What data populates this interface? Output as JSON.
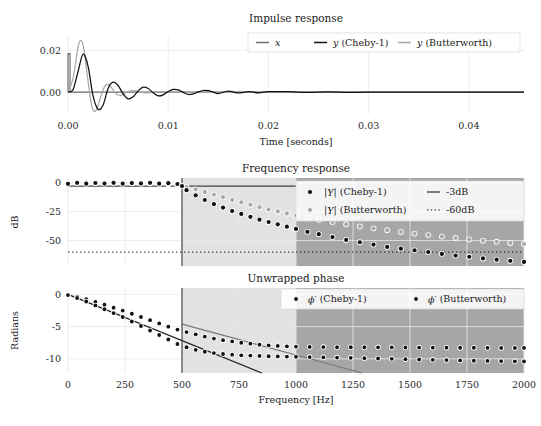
{
  "figure": {
    "width": 541,
    "height": 426,
    "background": "#ffffff"
  },
  "colors": {
    "x_signal": "#6e6e6e",
    "cheby": "#101010",
    "butterworth": "#a8a8a8",
    "grid": "#e9e9e9",
    "text": "#1a1a1a",
    "band_transition": "#e2e2e2",
    "band_stop": "#a6a6a6",
    "cutoff_line": "#3a3a3a",
    "ref_line": "#1a1a1a"
  },
  "panels": {
    "impulse": {
      "title": "Impulse response",
      "xlabel": "Time [seconds]",
      "ylabel": "",
      "xticks": [
        0.0,
        0.01,
        0.02,
        0.03,
        0.04
      ],
      "xticklabels": [
        "0.00",
        "0.01",
        "0.02",
        "0.03",
        "0.04"
      ],
      "yticks": [
        0.0,
        0.02
      ],
      "yticklabels": [
        "0.00",
        "0.02"
      ],
      "xlim": [
        0.0,
        0.0455
      ],
      "ylim": [
        -0.0105,
        0.027
      ],
      "legend": [
        {
          "label": "x",
          "marker": "line",
          "color": "#6e6e6e"
        },
        {
          "label": "y (Cheby-1)",
          "marker": "line",
          "color": "#101010"
        },
        {
          "label": "y (Butterworth)",
          "marker": "line",
          "color": "#a8a8a8"
        }
      ]
    },
    "magnitude": {
      "title": "Frequency response",
      "xlabel": "",
      "ylabel": "dB",
      "xticks": [
        0,
        250,
        500,
        750,
        1000,
        1250,
        1500,
        1750,
        2000
      ],
      "yticks": [
        0,
        -25,
        -50
      ],
      "yticklabels": [
        "0",
        "-25",
        "-50"
      ],
      "xlim": [
        0,
        2000
      ],
      "ylim": [
        -72,
        4
      ],
      "legend": [
        {
          "label": "|Y| (Cheby-1)",
          "marker": "dot",
          "color": "#101010"
        },
        {
          "label": "-3dB",
          "marker": "line",
          "color": "#1a1a1a"
        },
        {
          "label": "|Y| (Butterworth)",
          "marker": "dot",
          "color": "#a8a8a8"
        },
        {
          "label": "-60dB",
          "marker": "dotted",
          "color": "#1a1a1a"
        }
      ],
      "reference_lines": [
        {
          "name": "-3dB",
          "value": -3,
          "style": "solid"
        },
        {
          "name": "-60dB",
          "value": -60,
          "style": "dotted"
        }
      ]
    },
    "phase": {
      "title": "Unwrapped phase",
      "xlabel": "Frequency [Hz]",
      "ylabel": "Radians",
      "xticks": [
        0,
        250,
        500,
        750,
        1000,
        1250,
        1500,
        1750,
        2000
      ],
      "xticklabels": [
        "0",
        "250",
        "500",
        "750",
        "1000",
        "1250",
        "1500",
        "1750",
        "2000"
      ],
      "yticks": [
        0,
        -5,
        -10
      ],
      "yticklabels": [
        "0",
        "-5",
        "-10"
      ],
      "xlim": [
        0,
        2000
      ],
      "ylim": [
        -12.2,
        1.0
      ],
      "legend": [
        {
          "label": "ϕ′ (Cheby-1)",
          "marker": "dot",
          "color": "#101010"
        },
        {
          "label": "ϕ′ (Butterworth)",
          "marker": "dot",
          "color": "#101010"
        }
      ]
    }
  },
  "bands": {
    "passband_edge": 500,
    "transition": [
      500,
      1000
    ],
    "stopband": [
      1000,
      2000
    ]
  },
  "chart_data": {
    "type": "line",
    "subplots": [
      {
        "type": "line",
        "title": "Impulse response",
        "xlabel": "Time [seconds]",
        "ylabel": "",
        "xlim": [
          0.0,
          0.0455
        ],
        "ylim": [
          -0.0105,
          0.027
        ],
        "grid": true,
        "legend_position": "upper right",
        "series": [
          {
            "name": "x",
            "color": "#6e6e6e",
            "comment": "unit impulse at t=0, amplitude 0.0185, zero elsewhere",
            "x": [
              0.0,
              0.0002,
              0.0002,
              0.0455
            ],
            "values": [
              0.0185,
              0.0185,
              0.0,
              0.0
            ]
          },
          {
            "name": "y (Cheby-1)",
            "color": "#101010",
            "comment": "decaying ringing, 500 Hz Chebyshev-1 lowpass impulse response",
            "x": [
              0.0,
              0.0005,
              0.001,
              0.0015,
              0.002,
              0.0025,
              0.003,
              0.0035,
              0.004,
              0.0045,
              0.005,
              0.0055,
              0.006,
              0.0065,
              0.007,
              0.0075,
              0.008,
              0.0085,
              0.009,
              0.0095,
              0.01,
              0.0105,
              0.011,
              0.0115,
              0.012,
              0.0125,
              0.013,
              0.0135,
              0.014,
              0.0145,
              0.015,
              0.016,
              0.017,
              0.018,
              0.019,
              0.02,
              0.022,
              0.024,
              0.026,
              0.028,
              0.03,
              0.035,
              0.04,
              0.0455
            ],
            "values": [
              0.0,
              0.0012,
              0.0098,
              0.0182,
              0.0125,
              -0.0018,
              -0.0082,
              -0.0062,
              0.0018,
              0.0048,
              0.0032,
              -0.0008,
              -0.0032,
              -0.0022,
              0.0006,
              0.0024,
              0.0018,
              -0.0003,
              -0.0018,
              -0.0013,
              0.0003,
              0.0013,
              0.0011,
              -0.0001,
              -0.0011,
              -0.0008,
              0.0001,
              0.0008,
              0.0007,
              0.0,
              -0.0007,
              0.0005,
              -0.0004,
              0.0003,
              -0.0003,
              0.0002,
              0.0002,
              -0.0001,
              0.0001,
              -0.0001,
              0.0,
              0.0,
              0.0,
              0.0
            ]
          },
          {
            "name": "y (Butterworth)",
            "color": "#a8a8a8",
            "comment": "smoother, larger first peak, faster decay",
            "x": [
              0.0,
              0.0005,
              0.001,
              0.0013,
              0.0016,
              0.002,
              0.0024,
              0.0028,
              0.0032,
              0.0036,
              0.004,
              0.0044,
              0.0048,
              0.0052,
              0.0056,
              0.006,
              0.0065,
              0.007,
              0.0075,
              0.008,
              0.009,
              0.01,
              0.012,
              0.014,
              0.016,
              0.02,
              0.025,
              0.03,
              0.0455
            ],
            "values": [
              0.0,
              0.0065,
              0.0215,
              0.0248,
              0.0205,
              0.0052,
              -0.0072,
              -0.0088,
              -0.0032,
              0.0022,
              0.0038,
              0.0018,
              -0.0008,
              -0.0016,
              -0.0008,
              0.0003,
              0.0007,
              0.0004,
              -0.0002,
              -0.0003,
              0.0001,
              0.0001,
              0.0,
              0.0,
              0.0,
              0.0,
              0.0,
              0.0,
              0.0
            ]
          }
        ]
      },
      {
        "type": "scatter",
        "title": "Frequency response",
        "xlabel": "",
        "ylabel": "dB",
        "xlim": [
          0,
          2000
        ],
        "ylim": [
          -72,
          4
        ],
        "grid": true,
        "legend_position": "upper right",
        "series": [
          {
            "name": "|Y| (Cheby-1)",
            "color": "#101010",
            "x": [
              0,
              40,
              80,
              120,
              160,
              200,
              240,
              280,
              320,
              360,
              400,
              440,
              480,
              500,
              520,
              560,
              600,
              640,
              680,
              720,
              760,
              800,
              840,
              880,
              920,
              960,
              1000,
              1050,
              1100,
              1160,
              1220,
              1280,
              1340,
              1400,
              1460,
              1520,
              1580,
              1640,
              1700,
              1760,
              1820,
              1880,
              1940,
              2000
            ],
            "values": [
              -1.0,
              -0.2,
              -0.9,
              -0.3,
              -0.8,
              -0.2,
              -0.9,
              -0.4,
              -0.7,
              -0.2,
              -0.9,
              -0.5,
              -1.2,
              -3.0,
              -6.5,
              -11.0,
              -15.0,
              -18.5,
              -21.5,
              -24.5,
              -27.0,
              -29.5,
              -32.0,
              -34.0,
              -36.0,
              -38.0,
              -40.0,
              -42.5,
              -44.5,
              -47.0,
              -49.5,
              -51.5,
              -53.5,
              -55.5,
              -57.0,
              -58.5,
              -60.0,
              -61.5,
              -63.0,
              -64.0,
              -65.5,
              -66.5,
              -67.5,
              -68.5
            ]
          },
          {
            "name": "|Y| (Butterworth)",
            "color": "#a8a8a8",
            "x": [
              0,
              40,
              80,
              120,
              160,
              200,
              240,
              280,
              320,
              360,
              400,
              440,
              480,
              500,
              520,
              560,
              600,
              640,
              680,
              720,
              760,
              800,
              840,
              880,
              920,
              960,
              1000,
              1050,
              1100,
              1160,
              1220,
              1280,
              1340,
              1400,
              1460,
              1520,
              1580,
              1640,
              1700,
              1760,
              1820,
              1880,
              1940,
              2000
            ],
            "values": [
              0.0,
              0.0,
              0.0,
              0.0,
              -0.05,
              -0.1,
              -0.15,
              -0.25,
              -0.4,
              -0.6,
              -0.9,
              -1.4,
              -2.2,
              -3.0,
              -3.9,
              -5.8,
              -8.0,
              -10.3,
              -12.6,
              -14.9,
              -17.1,
              -19.2,
              -21.2,
              -23.1,
              -24.9,
              -26.6,
              -28.2,
              -30.2,
              -32.0,
              -34.1,
              -36.0,
              -37.8,
              -39.5,
              -41.1,
              -42.6,
              -44.0,
              -45.3,
              -46.6,
              -47.8,
              -49.0,
              -50.1,
              -51.1,
              -52.1,
              -53.0
            ]
          }
        ],
        "reference_lines": [
          {
            "name": "-3dB",
            "y": -3,
            "style": "solid",
            "color": "#1a1a1a"
          },
          {
            "name": "-60dB",
            "y": -60,
            "style": "dotted",
            "color": "#1a1a1a"
          }
        ]
      },
      {
        "type": "scatter",
        "title": "Unwrapped phase",
        "xlabel": "Frequency [Hz]",
        "ylabel": "Radians",
        "xlim": [
          0,
          2000
        ],
        "ylim": [
          -12.2,
          1.0
        ],
        "grid": true,
        "legend_position": "upper right",
        "series": [
          {
            "name": "ϕ′ (Cheby-1)",
            "color": "#101010",
            "x": [
              0,
              40,
              80,
              120,
              160,
              200,
              240,
              280,
              320,
              360,
              400,
              440,
              480,
              520,
              560,
              600,
              640,
              680,
              720,
              760,
              800,
              840,
              880,
              920,
              960,
              1000,
              1060,
              1120,
              1180,
              1240,
              1300,
              1360,
              1420,
              1480,
              1540,
              1600,
              1660,
              1720,
              1780,
              1840,
              1900,
              1960,
              2000
            ],
            "values": [
              -0.1,
              -0.55,
              -1.1,
              -1.7,
              -2.3,
              -2.9,
              -3.5,
              -4.2,
              -4.9,
              -5.6,
              -6.3,
              -7.0,
              -7.7,
              -8.2,
              -8.6,
              -8.9,
              -9.1,
              -9.25,
              -9.35,
              -9.45,
              -9.5,
              -9.55,
              -9.6,
              -9.62,
              -9.65,
              -9.68,
              -9.72,
              -9.76,
              -9.8,
              -9.85,
              -9.9,
              -9.95,
              -10.0,
              -10.05,
              -10.1,
              -10.15,
              -10.2,
              -10.25,
              -10.3,
              -10.32,
              -10.35,
              -10.38,
              -10.4
            ]
          },
          {
            "name": "ϕ′ (Butterworth)",
            "color": "#101010",
            "x": [
              0,
              40,
              80,
              120,
              160,
              200,
              240,
              280,
              320,
              360,
              400,
              440,
              480,
              520,
              560,
              600,
              640,
              680,
              720,
              760,
              800,
              840,
              880,
              920,
              960,
              1000,
              1060,
              1120,
              1180,
              1240,
              1300,
              1360,
              1420,
              1480,
              1540,
              1600,
              1660,
              1720,
              1780,
              1840,
              1900,
              1960,
              2000
            ],
            "values": [
              -0.05,
              -0.35,
              -0.75,
              -1.15,
              -1.6,
              -2.05,
              -2.5,
              -3.0,
              -3.5,
              -4.0,
              -4.5,
              -5.0,
              -5.45,
              -5.85,
              -6.2,
              -6.55,
              -6.85,
              -7.1,
              -7.3,
              -7.5,
              -7.65,
              -7.8,
              -7.9,
              -8.0,
              -8.05,
              -8.1,
              -8.15,
              -8.18,
              -8.2,
              -8.2,
              -8.2,
              -8.22,
              -8.22,
              -8.24,
              -8.25,
              -8.26,
              -8.27,
              -8.28,
              -8.28,
              -8.29,
              -8.3,
              -8.3,
              -8.3
            ]
          },
          {
            "name": "linear-phase reference",
            "color": "#1a1a1a",
            "style": "solid-line",
            "x": [
              0,
              850
            ],
            "values": [
              0.0,
              -12.2
            ]
          },
          {
            "name": "linear-phase reference 2",
            "color": "#6e6e6e",
            "style": "solid-line",
            "x": [
              500,
              1290
            ],
            "values": [
              -4.6,
              -12.2
            ]
          }
        ]
      }
    ]
  }
}
